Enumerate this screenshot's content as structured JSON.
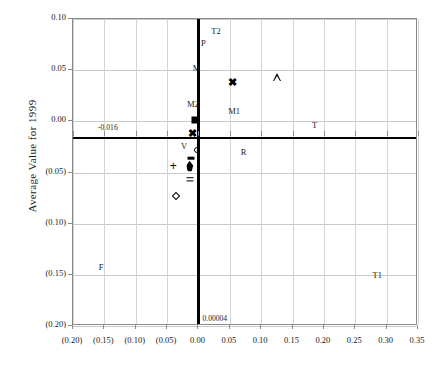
{
  "chart_data": {
    "type": "scatter",
    "title": "",
    "xlabel": "",
    "ylabel": "Average Value for 1999",
    "xlim": [
      -0.2,
      0.35
    ],
    "ylim": [
      -0.2,
      0.1
    ],
    "grid": true,
    "legend": "none",
    "xticks": [
      -0.2,
      -0.15,
      -0.1,
      -0.05,
      0.0,
      0.05,
      0.1,
      0.15,
      0.2,
      0.25,
      0.3,
      0.35
    ],
    "xticklabels": [
      "(0.20)",
      "(0.15)",
      "(0.10)",
      "(0.05)",
      "0.00",
      "0.05",
      "0.10",
      "0.15",
      "0.20",
      "0.25",
      "0.30",
      "0.35"
    ],
    "yticks": [
      0.1,
      0.05,
      0.0,
      -0.05,
      -0.1,
      -0.15,
      -0.2
    ],
    "yticklabels": [
      "0.10",
      "0.05",
      "0.00",
      "(0.05)",
      "(0.10)",
      "(0.15)",
      "(0.20)"
    ],
    "reference_lines": [
      {
        "orientation": "vertical",
        "value": 4e-05,
        "label": "0.00004",
        "emphasis": "bold"
      },
      {
        "orientation": "horizontal",
        "value": -0.016,
        "label": "-0.016",
        "emphasis": "bold"
      }
    ],
    "points": [
      {
        "label": "M2",
        "x": -0.005,
        "y": 0.001,
        "marker": "filled-square",
        "label_dx": -0.004,
        "label_dy": 0.016
      },
      {
        "label": "M",
        "x": 0.055,
        "y": 0.038,
        "marker": "bold-x",
        "label_dx": -0.058,
        "label_dy": 0.014
      },
      {
        "label": "M1",
        "x": 0.125,
        "y": 0.043,
        "marker": "open-triangle",
        "label_dx": -0.068,
        "label_dy": -0.033
      },
      {
        "label": "V",
        "x": -0.01,
        "y": -0.011,
        "marker": "bold-x",
        "label_dx": -0.013,
        "label_dy": -0.013
      },
      {
        "label": "R",
        "x": -0.003,
        "y": -0.028,
        "marker": "open-circle",
        "label_dx": 0.075,
        "label_dy": -0.002
      },
      {
        "label": "",
        "x": -0.012,
        "y": -0.036,
        "marker": "dash"
      },
      {
        "label": "",
        "x": -0.014,
        "y": -0.044,
        "marker": "filled-drop"
      },
      {
        "label": "",
        "x": -0.04,
        "y": -0.044,
        "marker": "plus"
      },
      {
        "label": "",
        "x": -0.014,
        "y": -0.055,
        "marker": "equals"
      },
      {
        "label": "",
        "x": -0.036,
        "y": -0.073,
        "marker": "open-diamond"
      },
      {
        "label": "T2",
        "x": 0.028,
        "y": 0.088,
        "marker": "none"
      },
      {
        "label": "P",
        "x": 0.008,
        "y": 0.077,
        "marker": "none"
      },
      {
        "label": "T",
        "x": 0.185,
        "y": -0.004,
        "marker": "none"
      },
      {
        "label": "F",
        "x": -0.155,
        "y": -0.142,
        "marker": "none"
      },
      {
        "label": "T1",
        "x": 0.285,
        "y": -0.15,
        "marker": "none"
      }
    ]
  },
  "annotations": {
    "y_reference_note": "-0.016",
    "x_reference_note": "0.00004"
  },
  "colors": {
    "marker": "#000000",
    "grid": "#c9c9c9",
    "frame": "#8a8a8a",
    "reference_line": "#000000",
    "text": "#1a1a1a",
    "background": "#ffffff"
  }
}
